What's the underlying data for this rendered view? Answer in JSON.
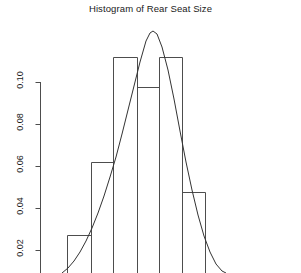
{
  "chart_data": {
    "type": "bar",
    "title": "Histogram of Rear Seat Size",
    "xlabel": "",
    "ylabel": "",
    "grid": false,
    "legend": null,
    "categories": [
      "67-91",
      "91-113",
      "113-137",
      "137-159",
      "159-182",
      "182-205"
    ],
    "values": [
      0.025,
      0.0675,
      0.1125,
      0.0975,
      0.1125,
      0.0525
    ],
    "ylim": [
      0.0,
      0.115
    ],
    "y_ticks": [
      0.1,
      0.08,
      0.06,
      0.04,
      0.02
    ],
    "y_tick_labels": [
      "0.10",
      "0.08",
      "0.06",
      "0.04",
      "0.02"
    ],
    "bar_edges_px": [
      67,
      91,
      113,
      137,
      159,
      182,
      205
    ],
    "bar_top_px": [
      235,
      162,
      57,
      87,
      57,
      192
    ],
    "series": [
      {
        "name": "Density",
        "type": "line",
        "peak_value": 0.1245,
        "peak_x_px": 147,
        "points_px": [
          [
            62,
            273
          ],
          [
            68,
            268
          ],
          [
            74,
            261
          ],
          [
            80,
            252
          ],
          [
            86,
            241
          ],
          [
            92,
            228
          ],
          [
            98,
            213
          ],
          [
            104,
            196
          ],
          [
            110,
            177
          ],
          [
            116,
            157
          ],
          [
            122,
            134
          ],
          [
            128,
            110
          ],
          [
            134,
            86
          ],
          [
            140,
            62
          ],
          [
            146,
            41
          ],
          [
            150,
            33
          ],
          [
            153,
            31
          ],
          [
            157,
            34
          ],
          [
            162,
            47
          ],
          [
            168,
            70
          ],
          [
            174,
            99
          ],
          [
            180,
            131
          ],
          [
            186,
            162
          ],
          [
            192,
            190
          ],
          [
            198,
            215
          ],
          [
            204,
            236
          ],
          [
            210,
            252
          ],
          [
            216,
            264
          ],
          [
            222,
            271
          ],
          [
            226,
            273
          ]
        ]
      }
    ],
    "axis": {
      "y_axis_x_px": 40,
      "y_axis_top_px": 82,
      "y_axis_bottom_px": 273,
      "tick_y_px": [
        82,
        124,
        166,
        208,
        250
      ],
      "tick_length_px": 5
    }
  },
  "y_labels": {
    "t0": "0.10",
    "t1": "0.08",
    "t2": "0.06",
    "t3": "0.04",
    "t4": "0.02"
  }
}
